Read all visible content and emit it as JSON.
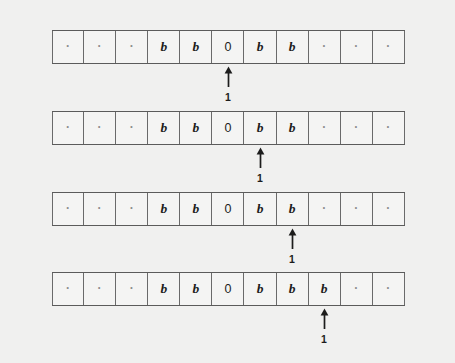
{
  "figure": {
    "background_color": "#f0f0ef",
    "tape_line_color": "#5b5b5b",
    "cell_border_color": "#6a6a6a",
    "cell_fill_color": "#f4f4f3",
    "symbol_color": "#1c1c1c",
    "dot_color": "#8d8d8d",
    "cell_count": 11,
    "cell_width_px": 32,
    "head_icon": "up-arrow-icon",
    "head_label": "1",
    "rows": [
      {
        "index": 1,
        "top_px": 30,
        "head_cell": 5,
        "head_label": "1",
        "cells": [
          {
            "symbol": "·",
            "kind": "dot"
          },
          {
            "symbol": "·",
            "kind": "dot"
          },
          {
            "symbol": "·",
            "kind": "dot"
          },
          {
            "symbol": "b",
            "kind": "blank-b"
          },
          {
            "symbol": "b",
            "kind": "blank-b"
          },
          {
            "symbol": "0",
            "kind": "digit"
          },
          {
            "symbol": "b",
            "kind": "blank-b"
          },
          {
            "symbol": "b",
            "kind": "blank-b"
          },
          {
            "symbol": "·",
            "kind": "dot"
          },
          {
            "symbol": "·",
            "kind": "dot"
          },
          {
            "symbol": "·",
            "kind": "dot"
          }
        ]
      },
      {
        "index": 2,
        "top_px": 111,
        "head_cell": 6,
        "head_label": "1",
        "cells": [
          {
            "symbol": "·",
            "kind": "dot"
          },
          {
            "symbol": "·",
            "kind": "dot"
          },
          {
            "symbol": "·",
            "kind": "dot"
          },
          {
            "symbol": "b",
            "kind": "blank-b"
          },
          {
            "symbol": "b",
            "kind": "blank-b"
          },
          {
            "symbol": "0",
            "kind": "digit"
          },
          {
            "symbol": "b",
            "kind": "blank-b"
          },
          {
            "symbol": "b",
            "kind": "blank-b"
          },
          {
            "symbol": "·",
            "kind": "dot"
          },
          {
            "symbol": "·",
            "kind": "dot"
          },
          {
            "symbol": "·",
            "kind": "dot"
          }
        ]
      },
      {
        "index": 3,
        "top_px": 192,
        "head_cell": 7,
        "head_label": "1",
        "cells": [
          {
            "symbol": "·",
            "kind": "dot"
          },
          {
            "symbol": "·",
            "kind": "dot"
          },
          {
            "symbol": "·",
            "kind": "dot"
          },
          {
            "symbol": "b",
            "kind": "blank-b"
          },
          {
            "symbol": "b",
            "kind": "blank-b"
          },
          {
            "symbol": "0",
            "kind": "digit"
          },
          {
            "symbol": "b",
            "kind": "blank-b"
          },
          {
            "symbol": "b",
            "kind": "blank-b"
          },
          {
            "symbol": "·",
            "kind": "dot"
          },
          {
            "symbol": "·",
            "kind": "dot"
          },
          {
            "symbol": "·",
            "kind": "dot"
          }
        ]
      },
      {
        "index": 4,
        "top_px": 272,
        "head_cell": 8,
        "head_label": "1",
        "cells": [
          {
            "symbol": "·",
            "kind": "dot"
          },
          {
            "symbol": "·",
            "kind": "dot"
          },
          {
            "symbol": "·",
            "kind": "dot"
          },
          {
            "symbol": "b",
            "kind": "blank-b"
          },
          {
            "symbol": "b",
            "kind": "blank-b"
          },
          {
            "symbol": "0",
            "kind": "digit"
          },
          {
            "symbol": "b",
            "kind": "blank-b"
          },
          {
            "symbol": "b",
            "kind": "blank-b"
          },
          {
            "symbol": "b",
            "kind": "blank-b"
          },
          {
            "symbol": "·",
            "kind": "dot"
          },
          {
            "symbol": "·",
            "kind": "dot"
          }
        ]
      }
    ]
  }
}
